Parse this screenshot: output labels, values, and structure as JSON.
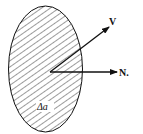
{
  "diagram": {
    "type": "vector-area-element",
    "labels": {
      "velocity": "V",
      "normal": "N.",
      "area": "Δa"
    },
    "colors": {
      "stroke": "#111111",
      "background": "#ffffff"
    }
  }
}
